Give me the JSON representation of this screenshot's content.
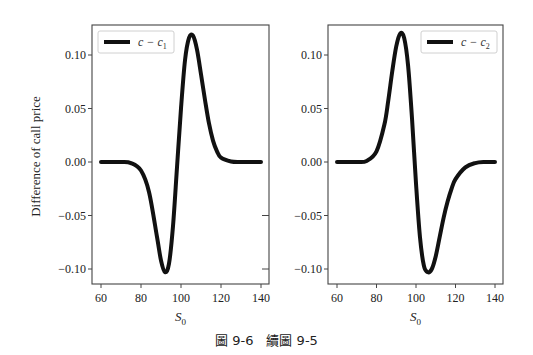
{
  "figure": {
    "caption": "圖 9-6　續圖 9-5",
    "ylabel": "Difference of call price"
  },
  "chart_data": [
    {
      "type": "line",
      "title": "",
      "xlabel": "S_0",
      "ylabel": "Difference of call price",
      "xlim": [
        56,
        144
      ],
      "ylim": [
        -0.115,
        0.128
      ],
      "xticks": [
        60,
        80,
        100,
        120,
        140
      ],
      "yticks": [
        -0.1,
        -0.05,
        0.0,
        0.05,
        0.1
      ],
      "ytick_labels": [
        "−0.10",
        "−0.05",
        "0.00",
        "0.05",
        "0.10"
      ],
      "grid": false,
      "legend_position": "upper left",
      "series": [
        {
          "name": "c − c1",
          "color": "#111111",
          "x": [
            60,
            70,
            75,
            80,
            84,
            88,
            90,
            92,
            94,
            96,
            98,
            100,
            102,
            104,
            106,
            108,
            110,
            112,
            114,
            116,
            118,
            120,
            125,
            130,
            140
          ],
          "y": [
            0.0,
            0.0,
            -0.001,
            -0.008,
            -0.028,
            -0.07,
            -0.092,
            -0.103,
            -0.095,
            -0.06,
            -0.005,
            0.05,
            0.095,
            0.116,
            0.118,
            0.105,
            0.082,
            0.058,
            0.036,
            0.02,
            0.01,
            0.004,
            0.0005,
            0.0,
            0.0
          ]
        }
      ]
    },
    {
      "type": "line",
      "title": "",
      "xlabel": "S_0",
      "ylabel": "",
      "xlim": [
        56,
        144
      ],
      "ylim": [
        -0.115,
        0.128
      ],
      "xticks": [
        60,
        80,
        100,
        120,
        140
      ],
      "yticks": [
        -0.1,
        -0.05,
        0.0,
        0.05,
        0.1
      ],
      "ytick_labels": [
        "−0.10",
        "−0.05",
        "0.00",
        "0.05",
        "0.10"
      ],
      "grid": false,
      "legend_position": "upper right",
      "series": [
        {
          "name": "c − c2",
          "color": "#111111",
          "x": [
            60,
            70,
            75,
            80,
            84,
            86,
            88,
            90,
            92,
            94,
            96,
            98,
            100,
            102,
            104,
            106,
            108,
            110,
            112,
            114,
            116,
            118,
            120,
            125,
            130,
            135,
            140
          ],
          "y": [
            0.0,
            0.0,
            0.001,
            0.01,
            0.035,
            0.058,
            0.085,
            0.108,
            0.12,
            0.116,
            0.09,
            0.04,
            -0.02,
            -0.07,
            -0.097,
            -0.103,
            -0.1,
            -0.088,
            -0.07,
            -0.052,
            -0.037,
            -0.025,
            -0.016,
            -0.005,
            -0.001,
            0.0,
            0.0
          ]
        }
      ]
    }
  ]
}
